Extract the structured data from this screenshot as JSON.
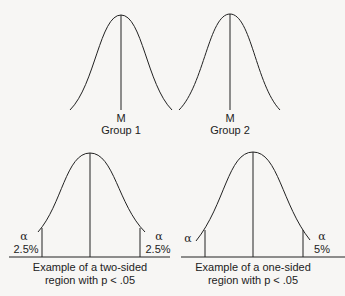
{
  "top": {
    "group1": {
      "mean_label": "M",
      "group_label": "Group 1"
    },
    "group2": {
      "mean_label": "M",
      "group_label": "Group 2"
    }
  },
  "bottom": {
    "two_sided": {
      "left_alpha": "α",
      "left_pct": "2.5%",
      "right_alpha": "α",
      "right_pct": "2.5%",
      "caption_line1": "Example of a two-sided",
      "caption_line2": "region with  p < .05"
    },
    "one_sided": {
      "left_alpha": "α",
      "right_alpha": "α",
      "right_pct": "5%",
      "caption_line1": "Example of a one-sided",
      "caption_line2": "region with p < .05"
    }
  },
  "colors": {
    "stroke": "#222222",
    "background": "#f7f6f4"
  }
}
